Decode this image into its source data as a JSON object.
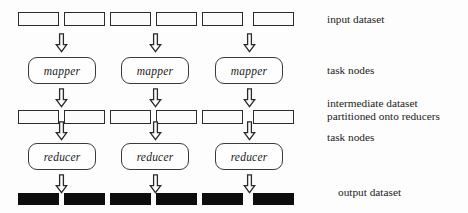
{
  "diagram": {
    "colors": {
      "background": "#fdfdfd",
      "outline": "#2b2b2b",
      "node_outline": "#3a3a3a",
      "filled_block": "#0d0d0d",
      "text": "#1c1c1c"
    },
    "rows": {
      "input": {
        "name": "input dataset",
        "block_style": "outlined",
        "blocks": [
          {
            "label": "",
            "x": 18,
            "y": 12,
            "w": 41,
            "h": 14
          },
          {
            "label": "",
            "x": 64,
            "y": 12,
            "w": 41,
            "h": 14
          },
          {
            "label": "",
            "x": 110,
            "y": 12,
            "w": 41,
            "h": 14
          },
          {
            "label": "",
            "x": 156,
            "y": 12,
            "w": 41,
            "h": 14
          },
          {
            "label": "",
            "x": 202,
            "y": 12,
            "w": 41,
            "h": 14
          },
          {
            "label": "",
            "x": 253,
            "y": 12,
            "w": 41,
            "h": 14
          }
        ]
      },
      "mappers": {
        "name": "task nodes",
        "nodes": [
          {
            "label": "mapper",
            "x": 28,
            "y": 57,
            "w": 68,
            "h": 27
          },
          {
            "label": "mapper",
            "x": 121,
            "y": 57,
            "w": 68,
            "h": 27
          },
          {
            "label": "mapper",
            "x": 215,
            "y": 57,
            "w": 68,
            "h": 27
          }
        ]
      },
      "intermediate": {
        "name": "intermediate dataset",
        "block_style": "outlined",
        "blocks": [
          {
            "label": "",
            "x": 18,
            "y": 110,
            "w": 41,
            "h": 14
          },
          {
            "label": "",
            "x": 64,
            "y": 110,
            "w": 41,
            "h": 14
          },
          {
            "label": "",
            "x": 110,
            "y": 110,
            "w": 41,
            "h": 14
          },
          {
            "label": "",
            "x": 156,
            "y": 110,
            "w": 41,
            "h": 14
          },
          {
            "label": "",
            "x": 202,
            "y": 110,
            "w": 41,
            "h": 14
          },
          {
            "label": "",
            "x": 253,
            "y": 110,
            "w": 41,
            "h": 14
          }
        ]
      },
      "reducers": {
        "name": "task nodes",
        "nodes": [
          {
            "label": "reducer",
            "x": 28,
            "y": 143,
            "w": 68,
            "h": 27
          },
          {
            "label": "reducer",
            "x": 121,
            "y": 143,
            "w": 68,
            "h": 27
          },
          {
            "label": "reducer",
            "x": 215,
            "y": 143,
            "w": 68,
            "h": 27
          }
        ]
      },
      "output": {
        "name": "output dataset",
        "block_style": "filled",
        "blocks": [
          {
            "label": "",
            "x": 18,
            "y": 193,
            "w": 41,
            "h": 12
          },
          {
            "label": "",
            "x": 64,
            "y": 193,
            "w": 41,
            "h": 12
          },
          {
            "label": "",
            "x": 110,
            "y": 193,
            "w": 41,
            "h": 12
          },
          {
            "label": "",
            "x": 156,
            "y": 193,
            "w": 41,
            "h": 12
          },
          {
            "label": "",
            "x": 202,
            "y": 193,
            "w": 41,
            "h": 12
          },
          {
            "label": "",
            "x": 253,
            "y": 193,
            "w": 41,
            "h": 12
          }
        ]
      }
    },
    "arrows": [
      {
        "name": "input-to-mapper-1",
        "x": 55,
        "y": 33
      },
      {
        "name": "input-to-mapper-2",
        "x": 149,
        "y": 33
      },
      {
        "name": "input-to-mapper-3",
        "x": 243,
        "y": 33
      },
      {
        "name": "mapper-to-intermediate-1",
        "x": 55,
        "y": 88
      },
      {
        "name": "mapper-to-intermediate-2",
        "x": 149,
        "y": 88
      },
      {
        "name": "mapper-to-intermediate-3",
        "x": 243,
        "y": 88
      },
      {
        "name": "intermediate-to-reducer-1",
        "x": 55,
        "y": 121
      },
      {
        "name": "intermediate-to-reducer-2",
        "x": 149,
        "y": 121
      },
      {
        "name": "intermediate-to-reducer-3",
        "x": 243,
        "y": 121
      },
      {
        "name": "reducer-to-output-1",
        "x": 55,
        "y": 174
      },
      {
        "name": "reducer-to-output-2",
        "x": 149,
        "y": 174
      },
      {
        "name": "reducer-to-output-3",
        "x": 243,
        "y": 174
      }
    ],
    "annotations": {
      "input_dataset": "input dataset",
      "task_nodes_mappers": "task nodes",
      "intermediate_line1": "intermediate dataset",
      "intermediate_line2": "partitioned onto reducers",
      "task_nodes_reducers": "task nodes",
      "output_dataset": "output dataset"
    }
  }
}
